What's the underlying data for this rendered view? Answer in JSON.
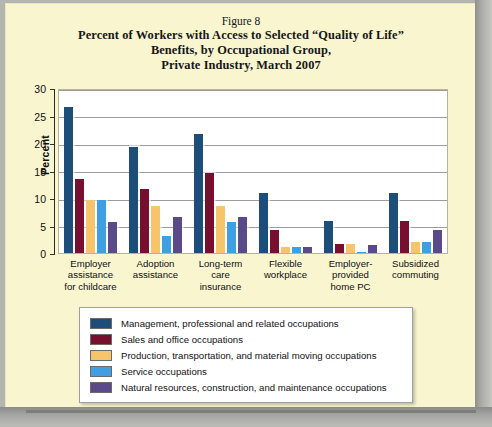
{
  "figure": {
    "number_label": "Figure 8",
    "title_lines": [
      "Percent of Workers with Access to Selected “Quality of Life”",
      "Benefits, by Occupational Group,",
      "Private Industry, March 2007"
    ]
  },
  "colors": {
    "background": "#f8f5cf",
    "plot_background": "#ffffff",
    "gridline": "#9c9c9c",
    "series": [
      "#1d4e79",
      "#77102f",
      "#f5c46b",
      "#3f9fe0",
      "#5b4a8a"
    ]
  },
  "chart_data": {
    "type": "bar",
    "title": "Percent of Workers with Access to Selected “Quality of Life” Benefits, by Occupational Group, Private Industry, March 2007",
    "xlabel": "",
    "ylabel": "Percent",
    "ylim": [
      0,
      30
    ],
    "yticks": [
      0,
      5,
      10,
      15,
      20,
      25,
      30
    ],
    "ytick_labels": [
      "0",
      "5",
      "10",
      "15",
      "20",
      "25",
      "30"
    ],
    "grid": true,
    "legend_position": "bottom",
    "categories": [
      "Employer assistance for childcare",
      "Adoption assistance",
      "Long-term care insurance",
      "Flexible workplace",
      "Employer-provided home PC",
      "Subsidized commuting"
    ],
    "category_lines": [
      [
        "Employer",
        "assistance",
        "for childcare"
      ],
      [
        "Adoption",
        "assistance"
      ],
      [
        "Long-term",
        "care",
        "insurance"
      ],
      [
        "Flexible",
        "workplace"
      ],
      [
        "Employer-",
        "provided",
        "home PC"
      ],
      [
        "Subsidized",
        "commuting"
      ]
    ],
    "series": [
      {
        "name": "Management, professional and related occupations",
        "color": "#1d4e79",
        "values": [
          27.0,
          19.7,
          22.0,
          11.3,
          6.2,
          11.3
        ]
      },
      {
        "name": "Sales and office occupations",
        "color": "#77102f",
        "values": [
          13.8,
          12.0,
          15.0,
          4.5,
          2.0,
          6.2
        ]
      },
      {
        "name": "Production, transportation, and material moving occupations",
        "color": "#f5c46b",
        "values": [
          10.0,
          9.0,
          9.0,
          1.5,
          2.0,
          2.4
        ]
      },
      {
        "name": "Service occupations",
        "color": "#3f9fe0",
        "values": [
          10.0,
          3.5,
          6.0,
          1.5,
          0.6,
          2.4
        ]
      },
      {
        "name": "Natural resources, construction, and maintenance occupations",
        "color": "#5b4a8a",
        "values": [
          6.0,
          7.0,
          7.0,
          1.5,
          1.8,
          4.5
        ]
      }
    ]
  }
}
